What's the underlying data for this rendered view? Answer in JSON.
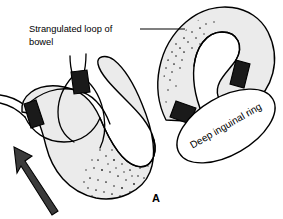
{
  "figure": {
    "panel_letter": "A",
    "background_color": "#ffffff",
    "bowel_fill_color": "#ebebeb",
    "outline_color": "#000000",
    "band_color": "#1a1a1a",
    "arrow_color": "#3b3b3b",
    "labels": {
      "strangulated_loop_line1": "Strangulated loop of",
      "strangulated_loop_line2": "bowel",
      "deep_inguinal_ring": "Deep inguinal ring"
    },
    "icons": {
      "direction_arrow": "arrow-up-left-icon",
      "leader": "leader-line"
    },
    "annotations": {
      "left_loop_name": "strangulated-bowel-loop",
      "right_loop_name": "herniated-bowel-loop",
      "ring_name": "deep-inguinal-ring-ellipse",
      "band_count": 4
    }
  }
}
